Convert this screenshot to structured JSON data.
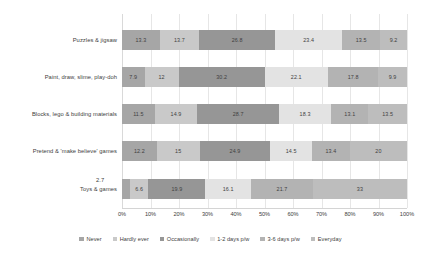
{
  "chart_data": {
    "type": "bar",
    "orientation": "horizontal",
    "stacked": true,
    "normalized_percent": true,
    "title": "",
    "xlabel": "",
    "ylabel": "",
    "xlim": [
      0,
      100
    ],
    "grid": true,
    "legend_position": "bottom",
    "categories": [
      "Puzzles & jigsaw",
      "Paint, draw, slime, play-doh",
      "Blocks, lego & building materials",
      "Pretend & 'make believe' games",
      "Toys & games"
    ],
    "series": [
      {
        "name": "Never",
        "color": "#a6a6a6",
        "values": [
          13.3,
          7.9,
          11.5,
          12.2,
          2.7
        ]
      },
      {
        "name": "Hardly ever",
        "color": "#c9c9c9",
        "values": [
          13.7,
          12,
          14.9,
          15,
          6.6
        ]
      },
      {
        "name": "Occasionally",
        "color": "#969696",
        "values": [
          26.8,
          30.2,
          28.7,
          24.9,
          19.9
        ]
      },
      {
        "name": "1-2 days p/w",
        "color": "#e3e3e3",
        "values": [
          23.4,
          22.1,
          18.3,
          14.5,
          16.1
        ]
      },
      {
        "name": "3-6 days p/w",
        "color": "#b3b3b3",
        "values": [
          13.5,
          17.8,
          13.1,
          13.4,
          21.7
        ]
      },
      {
        "name": "Everyday",
        "color": "#bdbdbd",
        "values": [
          9.2,
          9.9,
          13.5,
          20,
          33
        ]
      }
    ],
    "xticks": [
      "0%",
      "10%",
      "20%",
      "30%",
      "40%",
      "50%",
      "60%",
      "70%",
      "80%",
      "90%",
      "100%"
    ],
    "xtick_values": [
      0,
      10,
      20,
      30,
      40,
      50,
      60,
      70,
      80,
      90,
      100
    ],
    "annotations": [
      {
        "text": "2.7",
        "for_category": "Toys & games",
        "for_series": "Never"
      }
    ],
    "hidden_labels": [
      {
        "category": "Toys & games",
        "series": "Never",
        "reason": "segment too narrow; shown as callout above bar"
      }
    ]
  }
}
